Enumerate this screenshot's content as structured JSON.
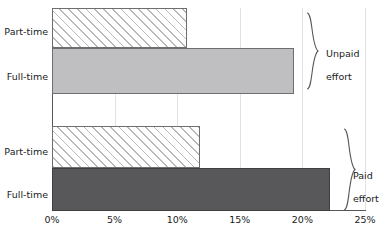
{
  "chart_data": {
    "type": "bar",
    "orientation": "horizontal",
    "title": "",
    "subtitle": "",
    "xlabel": "",
    "ylabel": "",
    "xlim": [
      0,
      25
    ],
    "xticks": [
      0,
      5,
      10,
      15,
      20,
      25
    ],
    "xtick_labels": [
      "0%",
      "5%",
      "10%",
      "15%",
      "20%",
      "25%"
    ],
    "grid": true,
    "legend": false,
    "legend_position": "none",
    "groups": [
      {
        "name": "Unpaid effort",
        "label": "Unpaid\neffort",
        "categories": [
          "Part-time",
          "Full-time"
        ],
        "values": [
          10.8,
          19.3
        ],
        "styles": [
          "hatched",
          "solid-light"
        ]
      },
      {
        "name": "Paid effort",
        "label": "Paid\neffort",
        "categories": [
          "Part-time",
          "Full-time"
        ],
        "values": [
          11.8,
          22.2
        ],
        "styles": [
          "hatched",
          "solid-dark"
        ]
      }
    ],
    "categories": [
      "Part-time",
      "Full-time",
      "Part-time",
      "Full-time"
    ],
    "values": [
      10.8,
      19.3,
      11.8,
      22.2
    ],
    "annotations": [
      "Unpaid effort",
      "Paid effort"
    ]
  },
  "axis": {
    "tick_0": "0%",
    "tick_1": "5%",
    "tick_2": "10%",
    "tick_3": "15%",
    "tick_4": "20%",
    "tick_5": "25%"
  },
  "bars": {
    "unpaid_part_time_label": "Part-time",
    "unpaid_full_time_label": "Full-time",
    "paid_part_time_label": "Part-time",
    "paid_full_time_label": "Full-time"
  },
  "groups": {
    "unpaid_line1": "Unpaid",
    "unpaid_line2": "effort",
    "paid_line1": "Paid",
    "paid_line2": "effort"
  },
  "colors": {
    "solid_light": "#bfbfc1",
    "solid_dark": "#58585a",
    "hatch_line": "#b9b9bb",
    "gridline": "#e2e2e4",
    "axis": "#58585a",
    "text": "#1a1a1a"
  }
}
